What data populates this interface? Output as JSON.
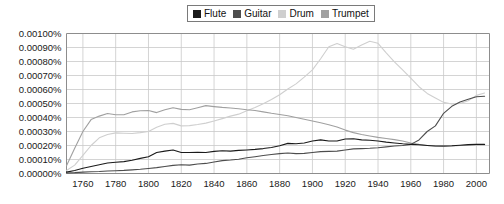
{
  "legend": {
    "position": "top-center",
    "items": [
      {
        "label": "Flute",
        "color": "#1a1a1a",
        "icon": "square-swatch-icon"
      },
      {
        "label": "Guitar",
        "color": "#4d4d4d",
        "icon": "square-swatch-icon"
      },
      {
        "label": "Drum",
        "color": "#cfcfcf",
        "icon": "square-swatch-icon"
      },
      {
        "label": "Trumpet",
        "color": "#a0a0a0",
        "icon": "square-swatch-icon"
      }
    ]
  },
  "chart_data": {
    "type": "line",
    "title": "",
    "subtitle": "",
    "xlabel": "",
    "ylabel": "",
    "grid": true,
    "xlim": [
      1750,
      2008
    ],
    "ylim": [
      0.0,
      0.001
    ],
    "y_tick_labels": [
      "0.00100%",
      "0.00090%",
      "0.00080%",
      "0.00070%",
      "0.00060%",
      "0.00050%",
      "0.00040%",
      "0.00030%",
      "0.00020%",
      "0.00010%",
      "0.00000%"
    ],
    "y_tick_values": [
      0.001,
      0.0009,
      0.0008,
      0.0007,
      0.0006,
      0.0005,
      0.0004,
      0.0003,
      0.0002,
      0.0001,
      0.0
    ],
    "x_tick_labels": [
      "1760",
      "1780",
      "1800",
      "1820",
      "1840",
      "1860",
      "1880",
      "1900",
      "1920",
      "1940",
      "1960",
      "1980",
      "2000"
    ],
    "x_tick_values": [
      1760,
      1780,
      1800,
      1820,
      1840,
      1860,
      1880,
      1900,
      1920,
      1940,
      1960,
      1980,
      2000
    ],
    "x": [
      1750,
      1755,
      1760,
      1765,
      1770,
      1775,
      1780,
      1785,
      1790,
      1795,
      1800,
      1805,
      1810,
      1815,
      1820,
      1825,
      1830,
      1835,
      1840,
      1845,
      1850,
      1855,
      1860,
      1865,
      1870,
      1875,
      1880,
      1885,
      1890,
      1895,
      1900,
      1905,
      1910,
      1915,
      1920,
      1925,
      1930,
      1935,
      1940,
      1945,
      1950,
      1955,
      1960,
      1965,
      1970,
      1975,
      1980,
      1985,
      1990,
      1995,
      2000,
      2005
    ],
    "series": [
      {
        "name": "Flute",
        "color": "#1a1a1a",
        "values": [
          1e-05,
          2.2e-05,
          3.8e-05,
          5e-05,
          6.2e-05,
          7.5e-05,
          8e-05,
          8.5e-05,
          9.5e-05,
          0.000108,
          0.00012,
          0.00015,
          0.00016,
          0.000168,
          0.00015,
          0.00015,
          0.000152,
          0.00015,
          0.000158,
          0.000162,
          0.00016,
          0.000165,
          0.000168,
          0.000172,
          0.000178,
          0.000186,
          0.000198,
          0.000215,
          0.000212,
          0.000218,
          0.000232,
          0.00024,
          0.000232,
          0.000232,
          0.000246,
          0.000248,
          0.00024,
          0.000238,
          0.000232,
          0.000224,
          0.000218,
          0.000212,
          0.000208,
          0.000205,
          0.0002,
          0.000196,
          0.000196,
          0.000198,
          0.000202,
          0.000206,
          0.000208,
          0.000208
        ]
      },
      {
        "name": "Guitar",
        "color": "#4d4d4d",
        "values": [
          4e-06,
          6e-06,
          1e-05,
          1.2e-05,
          1.4e-05,
          1.8e-05,
          2e-05,
          2.2e-05,
          2.6e-05,
          3e-05,
          3.6e-05,
          4.2e-05,
          5e-05,
          5.8e-05,
          6.2e-05,
          6e-05,
          6.8e-05,
          7.2e-05,
          8.2e-05,
          9.2e-05,
          9.6e-05,
          0.000102,
          0.000112,
          0.00012,
          0.000128,
          0.000136,
          0.000142,
          0.000146,
          0.000142,
          0.000144,
          0.00015,
          0.000156,
          0.000158,
          0.00016,
          0.000168,
          0.000176,
          0.000178,
          0.00018,
          0.000184,
          0.00019,
          0.000196,
          0.0002,
          0.000208,
          0.00024,
          0.0003,
          0.00034,
          0.00043,
          0.00048,
          0.00051,
          0.00053,
          0.000548,
          0.000552
        ]
      },
      {
        "name": "Drum",
        "color": "#cfcfcf",
        "values": [
          2.2e-05,
          6e-05,
          0.00013,
          0.0002,
          0.000255,
          0.000278,
          0.00029,
          0.000288,
          0.000286,
          0.000292,
          0.0003,
          0.00033,
          0.000352,
          0.000358,
          0.00034,
          0.000342,
          0.00035,
          0.00036,
          0.000375,
          0.000392,
          0.00041,
          0.000424,
          0.000448,
          0.000472,
          0.000498,
          0.000528,
          0.000562,
          0.000604,
          0.00064,
          0.000688,
          0.00074,
          0.00082,
          0.000905,
          0.000928,
          0.000905,
          0.000888,
          0.000918,
          0.000945,
          0.00093,
          0.000862,
          0.000798,
          0.00074,
          0.000682,
          0.00062,
          0.000572,
          0.00054,
          0.000508,
          0.000496,
          0.0005,
          0.00052,
          0.000558,
          0.000575
        ]
      },
      {
        "name": "Trumpet",
        "color": "#a0a0a0",
        "values": [
          5.5e-05,
          0.00018,
          0.0003,
          0.000385,
          0.00041,
          0.000428,
          0.00042,
          0.00042,
          0.00044,
          0.000448,
          0.00045,
          0.000435,
          0.000455,
          0.00047,
          0.000458,
          0.000455,
          0.00047,
          0.000485,
          0.000478,
          0.000472,
          0.000468,
          0.000462,
          0.000455,
          0.00045,
          0.00044,
          0.00043,
          0.000422,
          0.000412,
          0.0004,
          0.000388,
          0.000375,
          0.000362,
          0.000348,
          0.000332,
          0.00031,
          0.000292,
          0.000278,
          0.000268,
          0.000258,
          0.00025,
          0.000242,
          0.000232,
          0.000218,
          0.000208,
          0.0002,
          0.000196,
          0.000194,
          0.000196,
          0.0002,
          0.000202,
          0.000205,
          0.000206
        ]
      }
    ]
  }
}
